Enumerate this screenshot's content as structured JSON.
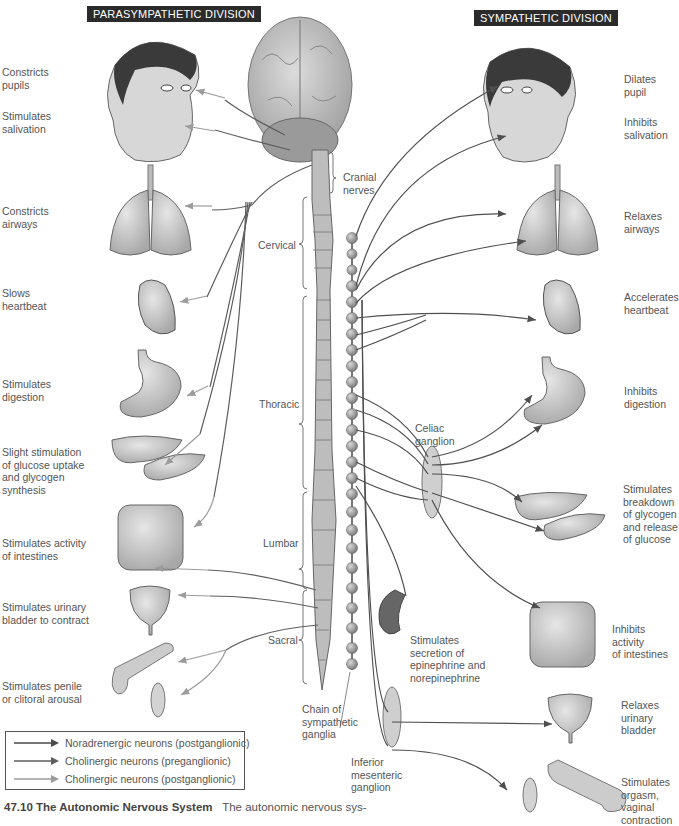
{
  "headers": {
    "parasympathetic": "PARASYMPATHETIC DIVISION",
    "sympathetic": "SYMPATHETIC DIVISION"
  },
  "parasympathetic_effects": [
    {
      "organ": "eye",
      "label": "Constricts\npupils"
    },
    {
      "organ": "salivary-glands",
      "label": "Stimulates\nsalivation"
    },
    {
      "organ": "lungs",
      "label": "Constricts\nairways"
    },
    {
      "organ": "heart",
      "label": "Slows\nheartbeat"
    },
    {
      "organ": "stomach",
      "label": "Stimulates\ndigestion"
    },
    {
      "organ": "liver-pancreas",
      "label": "Slight stimulation\nof glucose uptake\nand glycogen\nsynthesis"
    },
    {
      "organ": "intestines",
      "label": "Stimulates activity\nof intestines"
    },
    {
      "organ": "bladder",
      "label": "Stimulates urinary\nbladder to contract"
    },
    {
      "organ": "genitals",
      "label": "Stimulates penile\nor clitoral arousal"
    }
  ],
  "sympathetic_effects": [
    {
      "organ": "eye",
      "label": "Dilates\npupil"
    },
    {
      "organ": "salivary-glands",
      "label": "Inhibits\nsalivation"
    },
    {
      "organ": "lungs",
      "label": "Relaxes\nairways"
    },
    {
      "organ": "heart",
      "label": "Accelerates\nheartbeat"
    },
    {
      "organ": "stomach",
      "label": "Inhibits\ndigestion"
    },
    {
      "organ": "liver-pancreas",
      "label": "Stimulates\nbreakdown\nof glycogen\nand release\nof glucose"
    },
    {
      "organ": "adrenal",
      "label": "Stimulates\nsecretion of\nepinephrine and\nnorepinephrine"
    },
    {
      "organ": "intestines",
      "label": "Inhibits activity\nof intestines"
    },
    {
      "organ": "bladder",
      "label": "Relaxes\nurinary\nbladder"
    },
    {
      "organ": "genitals",
      "label": "Stimulates\norgasm,\nvaginal\ncontraction"
    }
  ],
  "spinal_regions": {
    "cranial": "Cranial\nnerves",
    "cervical": "Cervical",
    "thoracic": "Thoracic",
    "lumbar": "Lumbar",
    "sacral": "Sacral"
  },
  "structures": {
    "celiac": "Celiac\nganglion",
    "chain": "Chain of\nsympathetic\nganglia",
    "inferior_mesenteric": "Inferior\nmesenteric\nganglion"
  },
  "legend": [
    {
      "label": "Noradrenergic neurons (postganglionic)",
      "color": "#4a4a4a"
    },
    {
      "label": "Cholinergic neurons (preganglionic)",
      "color": "#5e5e5e"
    },
    {
      "label": "Cholinergic neurons (postganglionic)",
      "color": "#9a9a9a"
    }
  ],
  "caption": {
    "number_title": "47.10 The Autonomic Nervous System",
    "text": "The autonomic nervous sys-"
  },
  "colors": {
    "organ_fill": "#c9c9c9",
    "organ_stroke": "#6a6a6a",
    "nerve_dark": "#4f4f4f",
    "nerve_light": "#9c9c9c",
    "header_bg": "#2b2b2b"
  }
}
